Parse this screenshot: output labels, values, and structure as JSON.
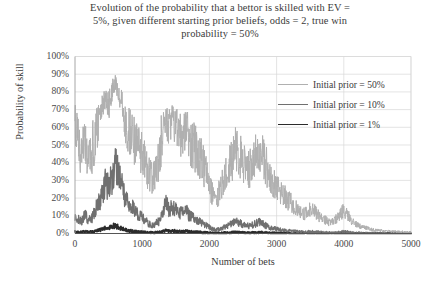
{
  "chart_data": {
    "type": "line",
    "title": "Evolution of the probability that a bettor is skilled with EV = 5%, given different starting prior beliefs, odds = 2, true win probability = 50%",
    "title_lines": [
      "Evolution of the probability that a bettor is skilled with EV =",
      "5%, given different starting prior beliefs, odds = 2, true win",
      "probability = 50%"
    ],
    "xlabel": "Number of bets",
    "ylabel": "Probability of skill",
    "xlim": [
      0,
      5000
    ],
    "ylim": [
      0,
      1.0
    ],
    "grid": true,
    "grid_x": true,
    "grid_y": true,
    "legend_position": "inside-top-right",
    "y_ticks": [
      0,
      0.1,
      0.2,
      0.3,
      0.4,
      0.5,
      0.6,
      0.7,
      0.8,
      0.9,
      1.0
    ],
    "y_tick_labels": [
      "0%",
      "10%",
      "20%",
      "30%",
      "40%",
      "50%",
      "60%",
      "70%",
      "80%",
      "90%",
      "100%"
    ],
    "x_ticks": [
      0,
      1000,
      2000,
      3000,
      4000,
      5000
    ],
    "x_tick_labels": [
      "0",
      "1000",
      "2000",
      "3000",
      "4000",
      "5000"
    ],
    "series": [
      {
        "name": "Initial prior = 50%",
        "color": "#b0b0b0",
        "width": 1.0,
        "x": [
          0,
          50,
          100,
          150,
          200,
          250,
          300,
          350,
          400,
          450,
          500,
          550,
          600,
          650,
          700,
          750,
          800,
          850,
          900,
          950,
          1000,
          1050,
          1100,
          1150,
          1200,
          1250,
          1300,
          1350,
          1400,
          1450,
          1500,
          1550,
          1600,
          1650,
          1700,
          1750,
          1800,
          1850,
          1900,
          1950,
          2000,
          2050,
          2100,
          2150,
          2200,
          2250,
          2300,
          2350,
          2400,
          2450,
          2500,
          2550,
          2600,
          2650,
          2700,
          2750,
          2800,
          2850,
          2900,
          2950,
          3000,
          3050,
          3100,
          3150,
          3200,
          3250,
          3300,
          3350,
          3400,
          3450,
          3500,
          3550,
          3600,
          3650,
          3700,
          3750,
          3800,
          3850,
          3900,
          3950,
          4000,
          4050,
          4100,
          4150,
          4200,
          4250,
          4300,
          4350,
          4400,
          4450,
          4500,
          4550,
          4600,
          4650,
          4700,
          4750,
          4800,
          4850,
          4900,
          4950,
          5000
        ],
        "y": [
          0.62,
          0.5,
          0.44,
          0.52,
          0.4,
          0.46,
          0.55,
          0.62,
          0.7,
          0.76,
          0.72,
          0.8,
          0.86,
          0.8,
          0.73,
          0.62,
          0.58,
          0.56,
          0.5,
          0.46,
          0.44,
          0.4,
          0.34,
          0.3,
          0.35,
          0.42,
          0.58,
          0.66,
          0.6,
          0.64,
          0.62,
          0.55,
          0.57,
          0.6,
          0.54,
          0.5,
          0.48,
          0.44,
          0.4,
          0.34,
          0.28,
          0.22,
          0.18,
          0.24,
          0.3,
          0.34,
          0.38,
          0.44,
          0.47,
          0.44,
          0.4,
          0.38,
          0.36,
          0.4,
          0.44,
          0.48,
          0.44,
          0.38,
          0.32,
          0.3,
          0.26,
          0.24,
          0.22,
          0.2,
          0.18,
          0.16,
          0.14,
          0.12,
          0.11,
          0.12,
          0.14,
          0.13,
          0.11,
          0.09,
          0.08,
          0.07,
          0.06,
          0.07,
          0.09,
          0.11,
          0.13,
          0.11,
          0.08,
          0.06,
          0.05,
          0.04,
          0.035,
          0.03,
          0.025,
          0.02,
          0.018,
          0.016,
          0.014,
          0.013,
          0.012,
          0.011,
          0.01,
          0.01,
          0.009,
          0.009,
          0.008
        ]
      },
      {
        "name": "Initial prior = 10%",
        "color": "#707070",
        "width": 1.3,
        "x": [
          0,
          50,
          100,
          150,
          200,
          250,
          300,
          350,
          400,
          450,
          500,
          550,
          600,
          650,
          700,
          750,
          800,
          850,
          900,
          950,
          1000,
          1050,
          1100,
          1150,
          1200,
          1250,
          1300,
          1350,
          1400,
          1450,
          1500,
          1550,
          1600,
          1650,
          1700,
          1750,
          1800,
          1850,
          1900,
          1950,
          2000,
          2050,
          2100,
          2150,
          2200,
          2250,
          2300,
          2350,
          2400,
          2450,
          2500,
          2550,
          2600,
          2650,
          2700,
          2750,
          2800,
          2850,
          2900,
          2950,
          3000,
          3050,
          3100,
          3150,
          3200,
          3250,
          3300,
          3350,
          3400,
          3450,
          3500,
          3550,
          3600,
          3650,
          3700,
          3750,
          3800,
          3850,
          3900,
          3950,
          4000,
          4050,
          4100,
          4150,
          4200,
          4250,
          4300,
          4350,
          4400,
          4450,
          4500,
          4550,
          4600,
          4650,
          4700,
          4750,
          4800,
          4850,
          4900,
          4950,
          5000
        ],
        "y": [
          0.1,
          0.08,
          0.07,
          0.11,
          0.07,
          0.09,
          0.13,
          0.17,
          0.22,
          0.28,
          0.26,
          0.32,
          0.38,
          0.32,
          0.26,
          0.19,
          0.16,
          0.15,
          0.12,
          0.1,
          0.09,
          0.07,
          0.055,
          0.045,
          0.055,
          0.07,
          0.12,
          0.17,
          0.13,
          0.15,
          0.14,
          0.11,
          0.12,
          0.13,
          0.1,
          0.09,
          0.08,
          0.07,
          0.06,
          0.045,
          0.035,
          0.025,
          0.02,
          0.027,
          0.035,
          0.042,
          0.05,
          0.062,
          0.068,
          0.06,
          0.05,
          0.046,
          0.042,
          0.05,
          0.058,
          0.065,
          0.055,
          0.042,
          0.034,
          0.03,
          0.025,
          0.022,
          0.019,
          0.017,
          0.015,
          0.013,
          0.011,
          0.01,
          0.009,
          0.01,
          0.011,
          0.01,
          0.009,
          0.008,
          0.007,
          0.006,
          0.005,
          0.006,
          0.007,
          0.009,
          0.011,
          0.009,
          0.007,
          0.005,
          0.004,
          0.0035,
          0.003,
          0.0027,
          0.0024,
          0.0021,
          0.0019,
          0.0017,
          0.0015,
          0.0014,
          0.0013,
          0.0012,
          0.0011,
          0.0011,
          0.001,
          0.001,
          0.001
        ]
      },
      {
        "name": "Initial prior = 1%",
        "color": "#2b2b2b",
        "width": 1.8,
        "x": [
          0,
          50,
          100,
          150,
          200,
          250,
          300,
          350,
          400,
          450,
          500,
          550,
          600,
          650,
          700,
          750,
          800,
          850,
          900,
          950,
          1000,
          1050,
          1100,
          1150,
          1200,
          1250,
          1300,
          1350,
          1400,
          1450,
          1500,
          1550,
          1600,
          1650,
          1700,
          1750,
          1800,
          1850,
          1900,
          1950,
          2000,
          2050,
          2100,
          2150,
          2200,
          2250,
          2300,
          2350,
          2400,
          2450,
          2500,
          2550,
          2600,
          2650,
          2700,
          2750,
          2800,
          2850,
          2900,
          2950,
          3000,
          3050,
          3100,
          3150,
          3200,
          3250,
          3300,
          3350,
          3400,
          3450,
          3500,
          3550,
          3600,
          3650,
          3700,
          3750,
          3800,
          3850,
          3900,
          3950,
          4000,
          4050,
          4100,
          4150,
          4200,
          4250,
          4300,
          4350,
          4400,
          4450,
          4500,
          4550,
          4600,
          4650,
          4700,
          4750,
          4800,
          4850,
          4900,
          4950,
          5000
        ],
        "y": [
          0.01,
          0.008,
          0.007,
          0.011,
          0.007,
          0.009,
          0.013,
          0.018,
          0.024,
          0.032,
          0.029,
          0.038,
          0.048,
          0.038,
          0.029,
          0.02,
          0.016,
          0.015,
          0.012,
          0.01,
          0.009,
          0.007,
          0.0055,
          0.0045,
          0.0055,
          0.007,
          0.012,
          0.018,
          0.013,
          0.015,
          0.014,
          0.011,
          0.012,
          0.013,
          0.01,
          0.009,
          0.008,
          0.007,
          0.006,
          0.0045,
          0.0035,
          0.0025,
          0.002,
          0.0027,
          0.0035,
          0.0042,
          0.005,
          0.0062,
          0.0068,
          0.006,
          0.005,
          0.0046,
          0.0042,
          0.005,
          0.0058,
          0.0065,
          0.0055,
          0.0042,
          0.0034,
          0.003,
          0.0025,
          0.0022,
          0.0019,
          0.0017,
          0.0015,
          0.0013,
          0.0011,
          0.001,
          0.0009,
          0.001,
          0.0011,
          0.001,
          0.0009,
          0.0008,
          0.0007,
          0.0006,
          0.0005,
          0.0006,
          0.0007,
          0.0009,
          0.0011,
          0.0009,
          0.0007,
          0.0005,
          0.0004,
          0.00035,
          0.0003,
          0.00027,
          0.00024,
          0.00021,
          0.00019,
          0.00017,
          0.00015,
          0.00014,
          0.00013,
          0.00012,
          0.00011,
          0.00011,
          0.0001,
          0.0001,
          0.0001
        ]
      }
    ]
  },
  "legend": {
    "items": [
      {
        "label": "Initial prior = 50%",
        "color": "#b0b0b0",
        "width": 1.0
      },
      {
        "label": "Initial prior = 10%",
        "color": "#707070",
        "width": 1.3
      },
      {
        "label": "Initial prior = 1%",
        "color": "#2b2b2b",
        "width": 1.8
      }
    ]
  },
  "colors": {
    "background": "#ffffff",
    "grid": "#d9d9d9",
    "axis": "#a6a6a6",
    "text": "#3a3a3a"
  }
}
